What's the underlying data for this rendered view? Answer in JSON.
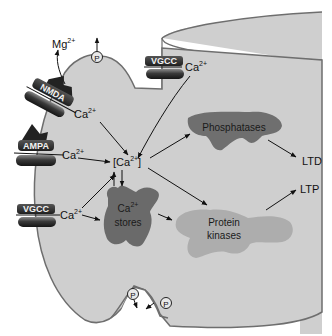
{
  "diagram": {
    "colors": {
      "cell_fill": "#cfcfcf",
      "cell_outline": "#6e6e6e",
      "phosphatases_fill": "#6f6f6f",
      "kinases_fill": "#adadad",
      "stores_fill": "#6a6a6a",
      "channel_dark": "#2b2b2b",
      "arrow": "#111111"
    },
    "ions": {
      "mg": {
        "base": "Mg",
        "charge": "2+"
      },
      "ca": {
        "base": "Ca",
        "charge": "2+"
      }
    },
    "channels": [
      {
        "id": "nmda",
        "label": "NMDA"
      },
      {
        "id": "ampa",
        "label": "AMPA"
      },
      {
        "id": "vgcc_left",
        "label": "VGCC"
      },
      {
        "id": "vgcc_top",
        "label": "VGCC"
      }
    ],
    "nodes": {
      "cytosolic_ca": {
        "open": "[Ca",
        "charge": "2+",
        "close": "]"
      },
      "ca_stores": {
        "line1": "Ca",
        "charge": "2+",
        "line2": "stores"
      },
      "phosphatases": {
        "label": "Phosphatases"
      },
      "protein_kinases": {
        "line1": "Protein",
        "line2": "kinases"
      },
      "ltd": {
        "label": "LTD"
      },
      "ltp": {
        "label": "LTP"
      }
    },
    "phospho_marker": "P",
    "edges": [
      {
        "from": "NMDA Ca2+",
        "to": "[Ca2+]"
      },
      {
        "from": "AMPA Ca2+",
        "to": "[Ca2+]"
      },
      {
        "from": "VGCC (left) Ca2+",
        "to": "[Ca2+]"
      },
      {
        "from": "VGCC (left) Ca2+",
        "to": "Ca2+ stores"
      },
      {
        "from": "VGCC (top) Ca2+",
        "to": "[Ca2+]"
      },
      {
        "from": "[Ca2+]",
        "to": "Ca2+ stores"
      },
      {
        "from": "Ca2+ stores",
        "to": "[Ca2+]"
      },
      {
        "from": "[Ca2+]",
        "to": "Phosphatases"
      },
      {
        "from": "[Ca2+]",
        "to": "Protein kinases"
      },
      {
        "from": "Ca2+ stores",
        "to": "Protein kinases"
      },
      {
        "from": "Phosphatases",
        "to": "LTD"
      },
      {
        "from": "Protein kinases",
        "to": "LTP"
      }
    ]
  }
}
